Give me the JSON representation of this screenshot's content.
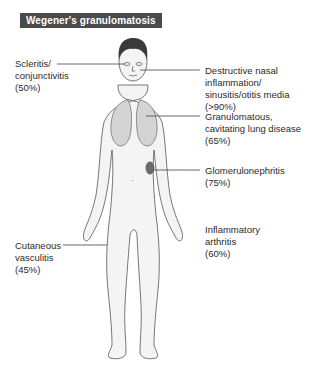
{
  "title": "Wegener's granulomatosis",
  "annotations": [
    {
      "id": "eyes",
      "text": "Scleritis/\nconjunctivitis\n(50%)",
      "condition": "Scleritis/conjunctivitis",
      "percent": "50%"
    },
    {
      "id": "nose",
      "text": "Destructive nasal\ninflammation/\nsinusitis/otitis media\n(>90%)",
      "condition": "Destructive nasal inflammation/sinusitis/otitis media",
      "percent": ">90%"
    },
    {
      "id": "lung",
      "text": "Granulomatous,\ncavitating lung disease\n(65%)",
      "condition": "Granulomatous, cavitating lung disease",
      "percent": "65%"
    },
    {
      "id": "kidney",
      "text": "Glomerulonephritis\n(75%)",
      "condition": "Glomerulonephritis",
      "percent": "75%"
    },
    {
      "id": "joints",
      "text": "Inflammatory\narthritis\n(60%)",
      "condition": "Inflammatory arthritis",
      "percent": "60%"
    },
    {
      "id": "skin",
      "text": "Cutaneous\nvasculitis\n(45%)",
      "condition": "Cutaneous vasculitis",
      "percent": "45%"
    }
  ],
  "colors": {
    "title_bg": "#4a4a4a",
    "body_fill": "#f4f4f4",
    "lung_fill": "#d4d4d4",
    "kidney_fill": "#6a6a6a",
    "hair": "#3a3a3a"
  }
}
